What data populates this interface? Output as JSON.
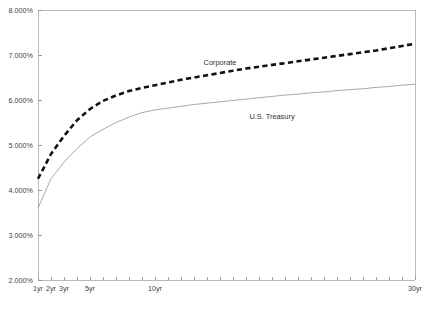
{
  "chart_data": {
    "type": "line",
    "title": "",
    "subtitle": "",
    "xlabel": "",
    "ylabel": "",
    "x": [
      1,
      2,
      3,
      4,
      5,
      6,
      7,
      8,
      9,
      10,
      11,
      12,
      13,
      14,
      15,
      16,
      17,
      18,
      19,
      20,
      21,
      22,
      23,
      24,
      25,
      26,
      27,
      28,
      29,
      30
    ],
    "xlim": [
      1,
      30
    ],
    "ylim": [
      2.0,
      8.0
    ],
    "grid": false,
    "legend_position": "inline-annotation",
    "y_tick_values": [
      2.0,
      3.0,
      4.0,
      5.0,
      6.0,
      7.0,
      8.0
    ],
    "y_tick_labels": [
      "2.000%",
      "3.000%",
      "4.000%",
      "5.000%",
      "6.000%",
      "7.000%",
      "8.000%"
    ],
    "x_tick_values": [
      1,
      2,
      3,
      4,
      5,
      6,
      7,
      8,
      9,
      10,
      11,
      12,
      13,
      14,
      15,
      16,
      17,
      18,
      19,
      20,
      21,
      22,
      23,
      24,
      25,
      26,
      27,
      28,
      29,
      30
    ],
    "x_tick_labeled": [
      {
        "value": 1,
        "label": "1yr"
      },
      {
        "value": 2,
        "label": "2yr"
      },
      {
        "value": 3,
        "label": "3yr"
      },
      {
        "value": 5,
        "label": "5yr"
      },
      {
        "value": 10,
        "label": "10yr"
      },
      {
        "value": 30,
        "label": "30yr"
      }
    ],
    "series": [
      {
        "name": "Corporate",
        "style": "dashed",
        "color": "#111111",
        "width": 2.6,
        "annotation_label": "Corporate",
        "annotation_x": 15,
        "annotation_y": 6.78,
        "values": [
          4.25,
          4.8,
          5.2,
          5.55,
          5.8,
          5.98,
          6.1,
          6.2,
          6.27,
          6.33,
          6.39,
          6.45,
          6.5,
          6.55,
          6.6,
          6.65,
          6.7,
          6.74,
          6.78,
          6.82,
          6.86,
          6.9,
          6.94,
          6.98,
          7.02,
          7.06,
          7.1,
          7.15,
          7.2,
          7.25
        ]
      },
      {
        "name": "U.S. Treasury",
        "style": "solid",
        "color": "#9f9f9f",
        "width": 0.9,
        "annotation_label": "U.S. Treasury",
        "annotation_x": 19,
        "annotation_y": 5.57,
        "values": [
          3.6,
          4.25,
          4.62,
          4.92,
          5.18,
          5.35,
          5.5,
          5.62,
          5.72,
          5.78,
          5.82,
          5.86,
          5.9,
          5.93,
          5.96,
          5.99,
          6.02,
          6.05,
          6.08,
          6.11,
          6.13,
          6.16,
          6.18,
          6.21,
          6.23,
          6.25,
          6.28,
          6.3,
          6.33,
          6.35
        ]
      }
    ]
  },
  "layout": {
    "plot_left": 38,
    "plot_right": 415,
    "plot_top": 10,
    "plot_bottom": 280,
    "tick_len": 3.5,
    "canvas_width": 430,
    "canvas_height": 316
  },
  "colors": {
    "frame": "#b9b9b9",
    "tick": "#9a9a9a",
    "text": "#3f3f3f",
    "corporate": "#111111",
    "treasury": "#9f9f9f",
    "background": "#ffffff"
  }
}
